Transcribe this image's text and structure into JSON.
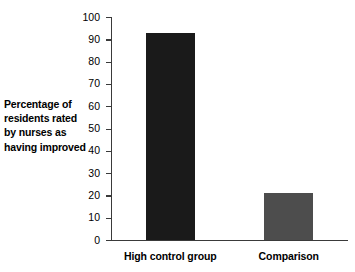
{
  "chart_data": {
    "type": "bar",
    "title": "",
    "xlabel": "",
    "ylabel": "Percentage of residents rated by nurses as having improved",
    "ylabel_lines": [
      "Percentage of",
      "residents rated",
      "by nurses as",
      "having improved"
    ],
    "categories": [
      "High control group",
      "Comparison"
    ],
    "values": [
      93,
      21
    ],
    "ylim": [
      0,
      100
    ],
    "ytick_step": 10,
    "yticks": [
      0,
      10,
      20,
      30,
      40,
      50,
      60,
      70,
      80,
      90,
      100
    ],
    "ytick_labels": [
      "0",
      "10",
      "20",
      "30",
      "40",
      "50",
      "60",
      "70",
      "80",
      "90",
      "100"
    ],
    "grid": false,
    "legend": false,
    "bar_colors": [
      "#1a1a1a",
      "#4d4d4d"
    ],
    "axis_color": "#3a3a3a",
    "background_color": "#ffffff"
  }
}
